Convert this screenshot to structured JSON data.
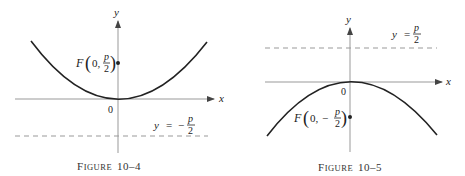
{
  "figures": [
    {
      "id": "fig-10-4",
      "caption_prefix": "F",
      "caption_smallcaps": "IGURE",
      "caption_number": "10–4",
      "x_axis_label": "x",
      "y_axis_label": "y",
      "origin_label": "0",
      "focus_label": {
        "letter": "F",
        "coord_x": "0,",
        "sign": "",
        "numerator": "p",
        "denominator": "2"
      },
      "directrix_label": {
        "lhs": "y",
        "eq": "=",
        "sign": "−",
        "numerator": "p",
        "denominator": "2"
      },
      "parabola": "opens upward, vertex at origin",
      "focus": "(0, p/2)",
      "directrix": "y = −p/2"
    },
    {
      "id": "fig-10-5",
      "caption_prefix": "F",
      "caption_smallcaps": "IGURE",
      "caption_number": "10–5",
      "x_axis_label": "x",
      "y_axis_label": "y",
      "origin_label": "0",
      "focus_label": {
        "letter": "F",
        "coord_x": "0,",
        "sign": "−",
        "numerator": "p",
        "denominator": "2"
      },
      "directrix_label": {
        "lhs": "y",
        "eq": "=",
        "sign": "",
        "numerator": "p",
        "denominator": "2"
      },
      "parabola": "opens downward, vertex at origin",
      "focus": "(0, −p/2)",
      "directrix": "y = p/2"
    }
  ],
  "colors": {
    "curve": "#222222",
    "axis": "#888888",
    "dash": "#999999",
    "text": "#222222"
  }
}
